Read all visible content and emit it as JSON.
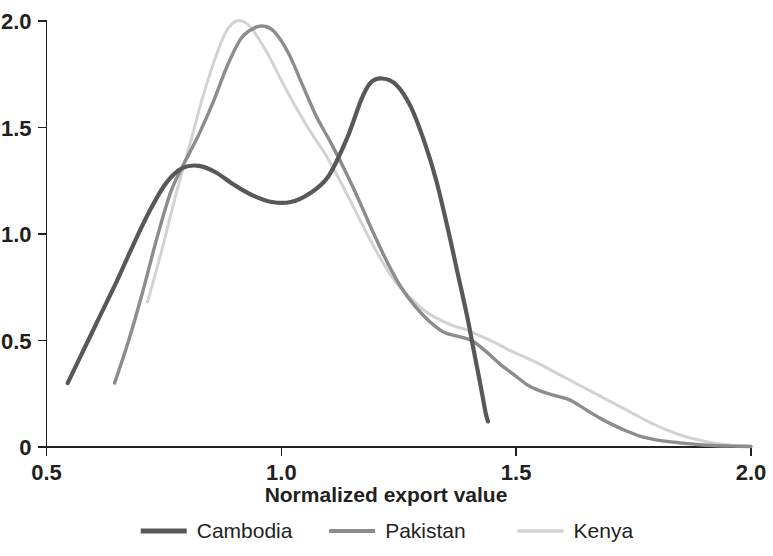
{
  "chart_data": {
    "type": "line",
    "title": "",
    "xlabel": "Normalized export value",
    "ylabel": "",
    "xlim": [
      0.5,
      2.0
    ],
    "ylim": [
      0,
      2.0
    ],
    "xticks": [
      "0.5",
      "1.0",
      "1.5",
      "2.0"
    ],
    "xtick_values": [
      0.5,
      1.0,
      1.5,
      2.0
    ],
    "yticks": [
      "0",
      "0.5",
      "1.0",
      "1.5",
      "2.0"
    ],
    "ytick_values": [
      0,
      0.5,
      1.0,
      1.5,
      2.0
    ],
    "grid": false,
    "legend_position": "bottom",
    "series": [
      {
        "name": "Cambodia",
        "color": "#585858",
        "width": 4.2,
        "dash": "none",
        "points": [
          [
            0.545,
            0.3
          ],
          [
            0.58,
            0.46
          ],
          [
            0.615,
            0.62
          ],
          [
            0.65,
            0.78
          ],
          [
            0.685,
            0.95
          ],
          [
            0.72,
            1.11
          ],
          [
            0.755,
            1.24
          ],
          [
            0.79,
            1.31
          ],
          [
            0.825,
            1.32
          ],
          [
            0.86,
            1.29
          ],
          [
            0.9,
            1.23
          ],
          [
            0.94,
            1.18
          ],
          [
            0.98,
            1.15
          ],
          [
            1.02,
            1.15
          ],
          [
            1.06,
            1.19
          ],
          [
            1.1,
            1.27
          ],
          [
            1.14,
            1.45
          ],
          [
            1.17,
            1.63
          ],
          [
            1.19,
            1.71
          ],
          [
            1.215,
            1.73
          ],
          [
            1.245,
            1.7
          ],
          [
            1.275,
            1.6
          ],
          [
            1.305,
            1.43
          ],
          [
            1.33,
            1.25
          ],
          [
            1.355,
            1.02
          ],
          [
            1.375,
            0.82
          ],
          [
            1.395,
            0.62
          ],
          [
            1.41,
            0.45
          ],
          [
            1.425,
            0.28
          ],
          [
            1.435,
            0.16
          ],
          [
            1.44,
            0.12
          ]
        ]
      },
      {
        "name": "Pakistan",
        "color": "#8c8c8c",
        "width": 3.4,
        "dash": "none",
        "points": [
          [
            0.645,
            0.3
          ],
          [
            0.675,
            0.5
          ],
          [
            0.705,
            0.73
          ],
          [
            0.735,
            0.98
          ],
          [
            0.765,
            1.2
          ],
          [
            0.795,
            1.34
          ],
          [
            0.825,
            1.47
          ],
          [
            0.855,
            1.62
          ],
          [
            0.885,
            1.79
          ],
          [
            0.915,
            1.92
          ],
          [
            0.945,
            1.97
          ],
          [
            0.965,
            1.975
          ],
          [
            0.985,
            1.95
          ],
          [
            1.015,
            1.85
          ],
          [
            1.045,
            1.7
          ],
          [
            1.075,
            1.55
          ],
          [
            1.105,
            1.43
          ],
          [
            1.135,
            1.3
          ],
          [
            1.165,
            1.16
          ],
          [
            1.195,
            1.01
          ],
          [
            1.225,
            0.87
          ],
          [
            1.255,
            0.75
          ],
          [
            1.285,
            0.66
          ],
          [
            1.315,
            0.59
          ],
          [
            1.345,
            0.54
          ],
          [
            1.375,
            0.52
          ],
          [
            1.405,
            0.5
          ],
          [
            1.435,
            0.45
          ],
          [
            1.465,
            0.39
          ],
          [
            1.495,
            0.34
          ],
          [
            1.525,
            0.29
          ],
          [
            1.555,
            0.26
          ],
          [
            1.585,
            0.24
          ],
          [
            1.615,
            0.22
          ],
          [
            1.645,
            0.18
          ],
          [
            1.675,
            0.14
          ],
          [
            1.705,
            0.105
          ],
          [
            1.735,
            0.075
          ],
          [
            1.765,
            0.05
          ],
          [
            1.795,
            0.035
          ],
          [
            1.825,
            0.025
          ],
          [
            1.855,
            0.018
          ],
          [
            1.885,
            0.012
          ],
          [
            1.92,
            0.007
          ],
          [
            1.96,
            0.004
          ],
          [
            2.0,
            0.002
          ]
        ]
      },
      {
        "name": "Kenya",
        "color": "#d2d2d2",
        "width": 3.0,
        "dash": "none",
        "points": [
          [
            0.715,
            0.68
          ],
          [
            0.745,
            0.92
          ],
          [
            0.775,
            1.18
          ],
          [
            0.805,
            1.42
          ],
          [
            0.835,
            1.66
          ],
          [
            0.865,
            1.86
          ],
          [
            0.885,
            1.96
          ],
          [
            0.905,
            2.0
          ],
          [
            0.925,
            1.99
          ],
          [
            0.945,
            1.94
          ],
          [
            0.975,
            1.83
          ],
          [
            1.005,
            1.7
          ],
          [
            1.035,
            1.58
          ],
          [
            1.065,
            1.47
          ],
          [
            1.095,
            1.37
          ],
          [
            1.125,
            1.25
          ],
          [
            1.155,
            1.12
          ],
          [
            1.185,
            0.99
          ],
          [
            1.215,
            0.87
          ],
          [
            1.245,
            0.77
          ],
          [
            1.275,
            0.7
          ],
          [
            1.305,
            0.64
          ],
          [
            1.335,
            0.6
          ],
          [
            1.365,
            0.57
          ],
          [
            1.395,
            0.55
          ],
          [
            1.425,
            0.52
          ],
          [
            1.455,
            0.49
          ],
          [
            1.485,
            0.455
          ],
          [
            1.515,
            0.425
          ],
          [
            1.545,
            0.395
          ],
          [
            1.575,
            0.36
          ],
          [
            1.605,
            0.325
          ],
          [
            1.635,
            0.29
          ],
          [
            1.665,
            0.255
          ],
          [
            1.695,
            0.22
          ],
          [
            1.725,
            0.185
          ],
          [
            1.755,
            0.15
          ],
          [
            1.785,
            0.115
          ],
          [
            1.815,
            0.085
          ],
          [
            1.845,
            0.06
          ],
          [
            1.875,
            0.04
          ],
          [
            1.905,
            0.025
          ],
          [
            1.935,
            0.014
          ],
          [
            1.965,
            0.007
          ],
          [
            2.0,
            0.003
          ]
        ]
      }
    ]
  },
  "legend": {
    "items": [
      {
        "label": "Cambodia",
        "color": "#585858",
        "width": 5
      },
      {
        "label": "Pakistan",
        "color": "#8c8c8c",
        "width": 4
      },
      {
        "label": "Kenya",
        "color": "#d2d2d2",
        "width": 3.5
      }
    ]
  },
  "axis": {
    "x_title": "Normalized export value"
  }
}
